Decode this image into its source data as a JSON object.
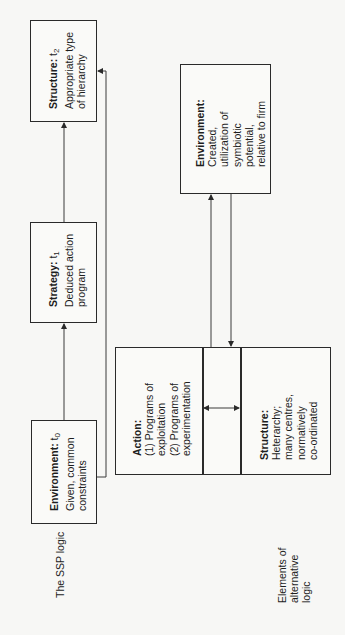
{
  "diagram": {
    "ssp_logic": {
      "label": "The SSP logic",
      "environment": {
        "title": "Environment:",
        "time": "t",
        "time_sub": "0",
        "lines": [
          "Given, common",
          "constraints"
        ]
      },
      "strategy": {
        "title": "Strategy:",
        "time": "t",
        "time_sub": "1",
        "lines": [
          "Deduced action",
          "program"
        ]
      },
      "structure": {
        "title": "Structure:",
        "time": "t",
        "time_sub": "2",
        "lines": [
          "Appropriate type",
          "of hierarchy"
        ]
      }
    },
    "alternative_logic": {
      "label_lines": [
        "Elements of",
        "alternative",
        "logic"
      ],
      "environment": {
        "title": "Environment:",
        "lines": [
          "Created,",
          "utilization of",
          "symbiotic",
          "potential,",
          "relative to firm"
        ]
      },
      "action": {
        "title": "Action:",
        "lines": [
          "(1) Programs of",
          "exploitation",
          "(2) Programs of",
          "experimentation"
        ]
      },
      "structure": {
        "title": "Structure:",
        "lines": [
          "Heterarchy;",
          "many centres,",
          "normatively",
          "co-ordinated"
        ]
      }
    },
    "connections": [
      {
        "from": "ssp_environment",
        "to": "ssp_strategy",
        "type": "arrow"
      },
      {
        "from": "ssp_strategy",
        "to": "ssp_structure",
        "type": "arrow"
      },
      {
        "from": "ssp_environment",
        "to": "ssp_structure",
        "type": "arrow"
      },
      {
        "from": "alt_action_structure",
        "to": "alt_environment",
        "type": "arrow"
      },
      {
        "from": "alt_environment",
        "to": "alt_action_structure",
        "type": "arrow"
      },
      {
        "from": "alt_action",
        "to": "alt_structure",
        "type": "bidirectional"
      }
    ],
    "colors": {
      "line": "#2a2a2a",
      "background": "#f7f7f5"
    }
  }
}
